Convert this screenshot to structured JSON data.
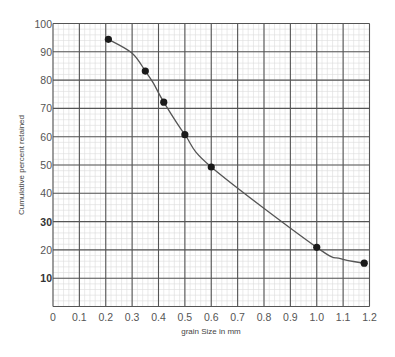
{
  "chart_data": {
    "type": "line",
    "title": "",
    "xlabel": "grain Size in mm",
    "ylabel": "Cumulative percent retained",
    "xlim": [
      0,
      1.2
    ],
    "ylim": [
      0,
      100
    ],
    "x_ticks": [
      0,
      0.1,
      0.2,
      0.3,
      0.4,
      0.5,
      0.6,
      0.7,
      0.8,
      0.9,
      1.0,
      1.1,
      1.2
    ],
    "x_tick_labels": [
      "0",
      "0.1",
      "0.2",
      "0.3",
      "0.4",
      "0.5",
      "0.6",
      "0.7",
      "0.8",
      "0.9",
      "1.0",
      "1.1",
      "1.2"
    ],
    "y_ticks": [
      10,
      20,
      30,
      40,
      50,
      60,
      70,
      80,
      90,
      100
    ],
    "y_tick_labels": [
      "10",
      "20",
      "30",
      "40",
      "50",
      "60",
      "70",
      "80",
      "90",
      "100"
    ],
    "y_bold_labels": [
      "10",
      "30"
    ],
    "grid": true,
    "minor_grid": true,
    "minor_subdivisions": 5,
    "legend": "none",
    "series": [
      {
        "name": "Cumulative percent retained",
        "x": [
          0.21,
          0.35,
          0.42,
          0.5,
          0.6,
          1.0,
          1.18
        ],
        "y": [
          94.4,
          83.2,
          72.2,
          60.7,
          49.3,
          20.9,
          15.3
        ],
        "markers": true,
        "curve_via": [
          [
            0.3,
            89.5
          ],
          [
            0.38,
            79.0
          ],
          [
            1.09,
            16.9
          ]
        ]
      }
    ],
    "colors": {
      "line": "#555555",
      "marker": "#1a1a1a",
      "major_grid": "#555555",
      "minor_grid": "#dcdcdc"
    }
  }
}
